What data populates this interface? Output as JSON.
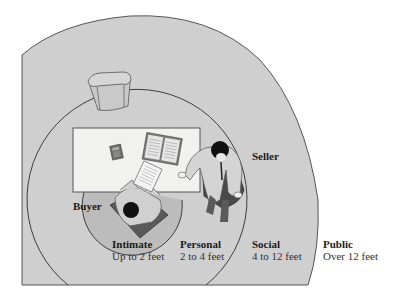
{
  "diagram": {
    "roles": {
      "buyer": "Buyer",
      "seller": "Seller"
    },
    "zones": [
      {
        "name": "Intimate",
        "range": "Up to 2 feet"
      },
      {
        "name": "Personal",
        "range": "2 to 4 feet"
      },
      {
        "name": "Social",
        "range": "4 to 12 feet"
      },
      {
        "name": "Public",
        "range": "Over 12 feet"
      }
    ],
    "colors": {
      "public_fill": "#cfcfcf",
      "personal_fill": "#cfcfcf",
      "intimate_fill": "#b9b9b9",
      "table_fill": "#f1f1ef",
      "outline": "#4a4a4a",
      "background": "#ffffff"
    },
    "objects": [
      "desk",
      "empty-chair",
      "calculator",
      "open-binder",
      "document",
      "buyer-chair",
      "seller-chair"
    ]
  }
}
